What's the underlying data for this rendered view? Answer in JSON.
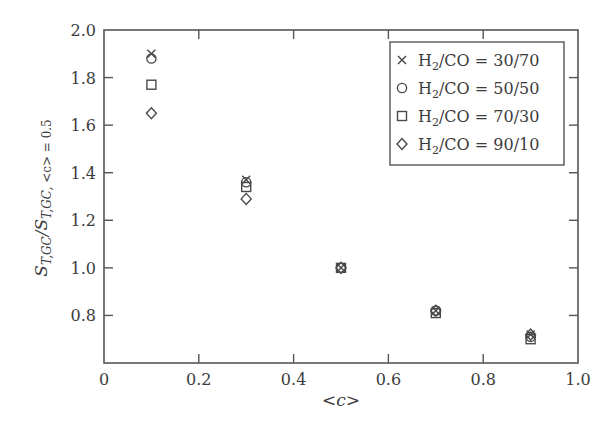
{
  "chart_data": {
    "type": "scatter",
    "title": "",
    "xlabel": "<c>",
    "ylabel": "S_T,GC / S_T,GC, <c> = 0.5",
    "xlim": [
      0,
      1.0
    ],
    "ylim": [
      0.6,
      2.0
    ],
    "xticks": [
      0,
      0.2,
      0.4,
      0.6,
      0.8,
      1.0
    ],
    "xtick_labels": [
      "0",
      "0.2",
      "0.4",
      "0.6",
      "0.8",
      "1.0"
    ],
    "yticks": [
      0.8,
      1.0,
      1.2,
      1.4,
      1.6,
      1.8,
      2.0
    ],
    "ytick_labels": [
      "0.8",
      "1.0",
      "1.2",
      "1.4",
      "1.6",
      "1.8",
      "2.0"
    ],
    "grid": false,
    "legend_position": "upper right",
    "x": [
      0.1,
      0.3,
      0.5,
      0.7,
      0.9
    ],
    "series": [
      {
        "name": "H2/CO = 30/70",
        "marker": "x",
        "values": [
          1.9,
          1.37,
          1.0,
          0.82,
          0.72
        ]
      },
      {
        "name": "H2/CO = 50/50",
        "marker": "circle",
        "values": [
          1.88,
          1.36,
          1.0,
          0.82,
          0.71
        ]
      },
      {
        "name": "H2/CO = 70/30",
        "marker": "square",
        "values": [
          1.77,
          1.34,
          1.0,
          0.81,
          0.7
        ]
      },
      {
        "name": "H2/CO = 90/10",
        "marker": "diamond",
        "values": [
          1.65,
          1.29,
          1.0,
          0.82,
          0.72
        ]
      }
    ]
  },
  "legend": {
    "items": [
      {
        "prefix": "H",
        "sub": "2",
        "suffix": "/CO = 30/70",
        "marker": "x"
      },
      {
        "prefix": "H",
        "sub": "2",
        "suffix": "/CO = 50/50",
        "marker": "circle"
      },
      {
        "prefix": "H",
        "sub": "2",
        "suffix": "/CO = 70/30",
        "marker": "square"
      },
      {
        "prefix": "H",
        "sub": "2",
        "suffix": "/CO = 90/10",
        "marker": "diamond"
      }
    ]
  },
  "axes": {
    "xlabel": "<c>",
    "ylabel_main": "S",
    "ylabel_sub1": "T,GC",
    "ylabel_slash": "/S",
    "ylabel_sub2": "T,GC, ",
    "ylabel_cond": "<c> = 0.5"
  },
  "colors": {
    "axis": "#555555",
    "marker": "#4a4a4a",
    "text": "#3c3c3c"
  }
}
